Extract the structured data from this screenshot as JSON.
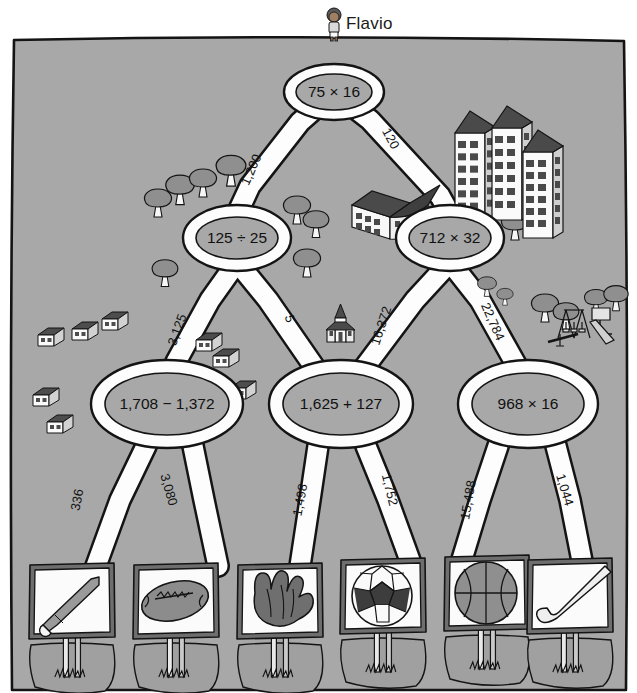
{
  "figure": {
    "character_name": "Flavio",
    "colors": {
      "field": "#a8a8a8",
      "road": "#fdfdfd",
      "ink": "#141414",
      "tree": "#909090",
      "roof": "#4a4a4a",
      "sign_face": "#fbfbfb",
      "sign_frame": "#6e6e6e",
      "ball_dark": "#3d3d3d",
      "ball_mid": "#8c8c8c"
    }
  },
  "tree": {
    "type": "flowchart-maze",
    "levels": 3,
    "root": {
      "id": "n0",
      "label": "75 × 16",
      "x": 334,
      "y": 92
    },
    "level2": [
      {
        "id": "n1",
        "label": "125 ÷ 25",
        "x": 237,
        "y": 238
      },
      {
        "id": "n2",
        "label": "712 × 32",
        "x": 450,
        "y": 238
      }
    ],
    "level3": [
      {
        "id": "n3",
        "label": "1,708 − 1,372",
        "x": 167,
        "y": 404
      },
      {
        "id": "n4",
        "label": "1,625 + 127",
        "x": 341,
        "y": 404
      },
      {
        "id": "n5",
        "label": "968 × 16",
        "x": 528,
        "y": 404
      }
    ],
    "edges": [
      {
        "from": "n0",
        "to": "n1",
        "label": "1,200",
        "lx": 252,
        "ly": 170,
        "rot": -66
      },
      {
        "from": "n0",
        "to": "n2",
        "label": "120",
        "lx": 390,
        "ly": 139,
        "rot": 62
      },
      {
        "from": "n1",
        "to": "n3",
        "label": "3,125",
        "lx": 178,
        "ly": 330,
        "rot": -70
      },
      {
        "from": "n1",
        "to": "n4",
        "label": "5",
        "lx": 289,
        "ly": 319,
        "rot": 76
      },
      {
        "from": "n2",
        "to": "n4",
        "label": "16,372",
        "lx": 382,
        "ly": 326,
        "rot": -72
      },
      {
        "from": "n2",
        "to": "n5",
        "label": "22,784",
        "lx": 492,
        "ly": 322,
        "rot": 66
      },
      {
        "from": "n3",
        "to": "s1",
        "label": "336",
        "lx": 78,
        "ly": 500,
        "rot": -79
      },
      {
        "from": "n3",
        "to": "s2",
        "label": "3,080",
        "lx": 168,
        "ly": 490,
        "rot": 74
      },
      {
        "from": "n4",
        "to": "s3",
        "label": "1,498",
        "lx": 301,
        "ly": 500,
        "rot": -79
      },
      {
        "from": "n4",
        "to": "s4",
        "label": "1,752",
        "lx": 389,
        "ly": 490,
        "rot": 76
      },
      {
        "from": "n5",
        "to": "s5",
        "label": "15,488",
        "lx": 469,
        "ly": 500,
        "rot": -80
      },
      {
        "from": "n5",
        "to": "s6",
        "label": "1,044",
        "lx": 564,
        "ly": 490,
        "rot": 73
      }
    ]
  },
  "signs": [
    {
      "id": "s1",
      "icon": "baseball-bat-icon",
      "x": 29,
      "y": 563
    },
    {
      "id": "s2",
      "icon": "football-icon",
      "x": 133,
      "y": 563
    },
    {
      "id": "s3",
      "icon": "baseball-glove-icon",
      "x": 237,
      "y": 563
    },
    {
      "id": "s4",
      "icon": "soccer-ball-icon",
      "x": 340,
      "y": 558
    },
    {
      "id": "s5",
      "icon": "basketball-icon",
      "x": 444,
      "y": 555
    },
    {
      "id": "s6",
      "icon": "hockey-stick-icon",
      "x": 527,
      "y": 558
    }
  ],
  "scenery": {
    "trees": [
      {
        "x": 158,
        "y": 205,
        "s": 1.0
      },
      {
        "x": 180,
        "y": 192,
        "s": 1.05
      },
      {
        "x": 203,
        "y": 185,
        "s": 1.0
      },
      {
        "x": 231,
        "y": 173,
        "s": 1.1
      },
      {
        "x": 165,
        "y": 275,
        "s": 0.95
      },
      {
        "x": 297,
        "y": 212,
        "s": 1.0
      },
      {
        "x": 316,
        "y": 226,
        "s": 0.95
      },
      {
        "x": 307,
        "y": 265,
        "s": 1.0
      },
      {
        "x": 515,
        "y": 228,
        "s": 1.0
      },
      {
        "x": 536,
        "y": 221,
        "s": 1.05
      },
      {
        "x": 509,
        "y": 209,
        "s": 0.8
      },
      {
        "x": 469,
        "y": 162,
        "s": 0.9
      },
      {
        "x": 545,
        "y": 310,
        "s": 1.0
      },
      {
        "x": 566,
        "y": 318,
        "s": 0.95
      },
      {
        "x": 596,
        "y": 303,
        "s": 0.85
      },
      {
        "x": 616,
        "y": 300,
        "s": 0.9
      },
      {
        "x": 487,
        "y": 288,
        "s": 0.7
      },
      {
        "x": 505,
        "y": 298,
        "s": 0.6
      }
    ],
    "houses": [
      {
        "x": 38,
        "y": 337
      },
      {
        "x": 72,
        "y": 331
      },
      {
        "x": 102,
        "y": 321
      },
      {
        "x": 33,
        "y": 397
      },
      {
        "x": 47,
        "y": 424
      },
      {
        "x": 196,
        "y": 342
      },
      {
        "x": 213,
        "y": 358
      },
      {
        "x": 230,
        "y": 390
      }
    ],
    "buildings": [
      {
        "x": 455,
        "y": 133,
        "w": 30,
        "h": 88
      },
      {
        "x": 492,
        "y": 128,
        "w": 30,
        "h": 92
      },
      {
        "x": 523,
        "y": 152,
        "w": 30,
        "h": 86
      }
    ],
    "school": {
      "x": 352,
      "y": 183
    },
    "church": {
      "x": 327,
      "y": 304
    },
    "playground": {
      "x": 566,
      "y": 318
    }
  }
}
